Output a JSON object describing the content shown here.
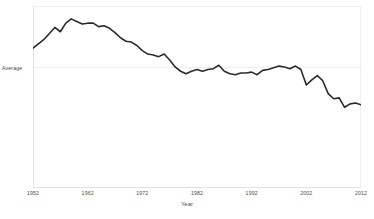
{
  "chart_data": {
    "type": "line",
    "title": "",
    "subtitle": "",
    "xlabel": "Year",
    "ylabel": "Average",
    "grid": true,
    "legend": false,
    "legend_position": "none",
    "line_color": "#2b2b2b",
    "gridline_color": "#ededed",
    "background_color": "#ffffff",
    "xlim": [
      1952,
      2012
    ],
    "xticks": [
      1952,
      1962,
      1972,
      1982,
      1992,
      2002,
      2012
    ],
    "xtick_labels": [
      "1952",
      "1962",
      "1972",
      "1982",
      "1992",
      "2002",
      "2012"
    ],
    "yticks": [
      0
    ],
    "ytick_labels": [
      "Average"
    ],
    "ylim": [
      -1.4,
      0.72
    ],
    "annotations": [],
    "x": [
      1952,
      1953,
      1954,
      1955,
      1956,
      1957,
      1958,
      1959,
      1960,
      1961,
      1962,
      1963,
      1964,
      1965,
      1966,
      1967,
      1968,
      1969,
      1970,
      1971,
      1972,
      1973,
      1974,
      1975,
      1976,
      1977,
      1978,
      1979,
      1980,
      1981,
      1982,
      1983,
      1984,
      1985,
      1986,
      1987,
      1988,
      1989,
      1990,
      1991,
      1992,
      1993,
      1994,
      1995,
      1996,
      1997,
      1998,
      1999,
      2000,
      2001,
      2002,
      2003,
      2004,
      2005,
      2006,
      2007,
      2008,
      2009,
      2010,
      2011,
      2012
    ],
    "values": [
      0.23,
      0.28,
      0.33,
      0.4,
      0.47,
      0.42,
      0.52,
      0.57,
      0.54,
      0.51,
      0.52,
      0.52,
      0.48,
      0.49,
      0.46,
      0.41,
      0.35,
      0.31,
      0.3,
      0.26,
      0.2,
      0.16,
      0.15,
      0.13,
      0.16,
      0.09,
      0.01,
      -0.04,
      -0.07,
      -0.04,
      -0.02,
      -0.04,
      -0.02,
      -0.01,
      0.03,
      -0.04,
      -0.07,
      -0.08,
      -0.06,
      -0.06,
      -0.05,
      -0.08,
      -0.03,
      -0.02,
      0.0,
      0.02,
      0.01,
      -0.01,
      0.02,
      -0.02,
      -0.2,
      -0.14,
      -0.09,
      -0.15,
      -0.3,
      -0.36,
      -0.35,
      -0.46,
      -0.42,
      -0.41,
      -0.43
    ],
    "series": [
      {
        "name": "Average",
        "values": [
          0.23,
          0.28,
          0.33,
          0.4,
          0.47,
          0.42,
          0.52,
          0.57,
          0.54,
          0.51,
          0.52,
          0.52,
          0.48,
          0.49,
          0.46,
          0.41,
          0.35,
          0.31,
          0.3,
          0.26,
          0.2,
          0.16,
          0.15,
          0.13,
          0.16,
          0.09,
          0.01,
          -0.04,
          -0.07,
          -0.04,
          -0.02,
          -0.04,
          -0.02,
          -0.01,
          0.03,
          -0.04,
          -0.07,
          -0.08,
          -0.06,
          -0.06,
          -0.05,
          -0.08,
          -0.03,
          -0.02,
          0.0,
          0.02,
          0.01,
          -0.01,
          0.02,
          -0.02,
          -0.2,
          -0.14,
          -0.09,
          -0.15,
          -0.3,
          -0.36,
          -0.35,
          -0.46,
          -0.42,
          -0.41,
          -0.43
        ]
      }
    ]
  },
  "axes": {
    "y_label": "Average",
    "x_title": "Year"
  }
}
